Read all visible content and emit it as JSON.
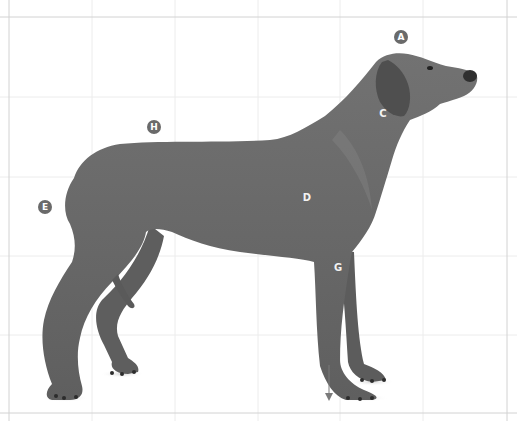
{
  "diagram": {
    "colors": {
      "background": "#ffffff",
      "grid": "#e6e6e6",
      "border": "#cfcfcf",
      "coat": "#6f6f6f",
      "coat_dark": "#4e4e4e",
      "marker": "#6a6a6a",
      "marker_text": "#ffffff",
      "arrow": "#7a7a7a"
    },
    "markers": [
      {
        "label": "A",
        "x": 401,
        "y": 37,
        "placement": "outside",
        "region": "skull top"
      },
      {
        "label": "C",
        "x": 383,
        "y": 114,
        "placement": "inside",
        "region": "neck"
      },
      {
        "label": "D",
        "x": 307,
        "y": 198,
        "placement": "inside",
        "region": "chest / shoulder"
      },
      {
        "label": "E",
        "x": 45,
        "y": 207,
        "placement": "outside",
        "region": "rear / hindquarters"
      },
      {
        "label": "G",
        "x": 338,
        "y": 268,
        "placement": "inside",
        "region": "foreleg"
      },
      {
        "label": "H",
        "x": 154,
        "y": 127,
        "placement": "outside",
        "region": "back / topline"
      }
    ],
    "plumb_arrow": {
      "x": 329,
      "y_start": 365,
      "y_end": 400,
      "direction": "down"
    }
  }
}
